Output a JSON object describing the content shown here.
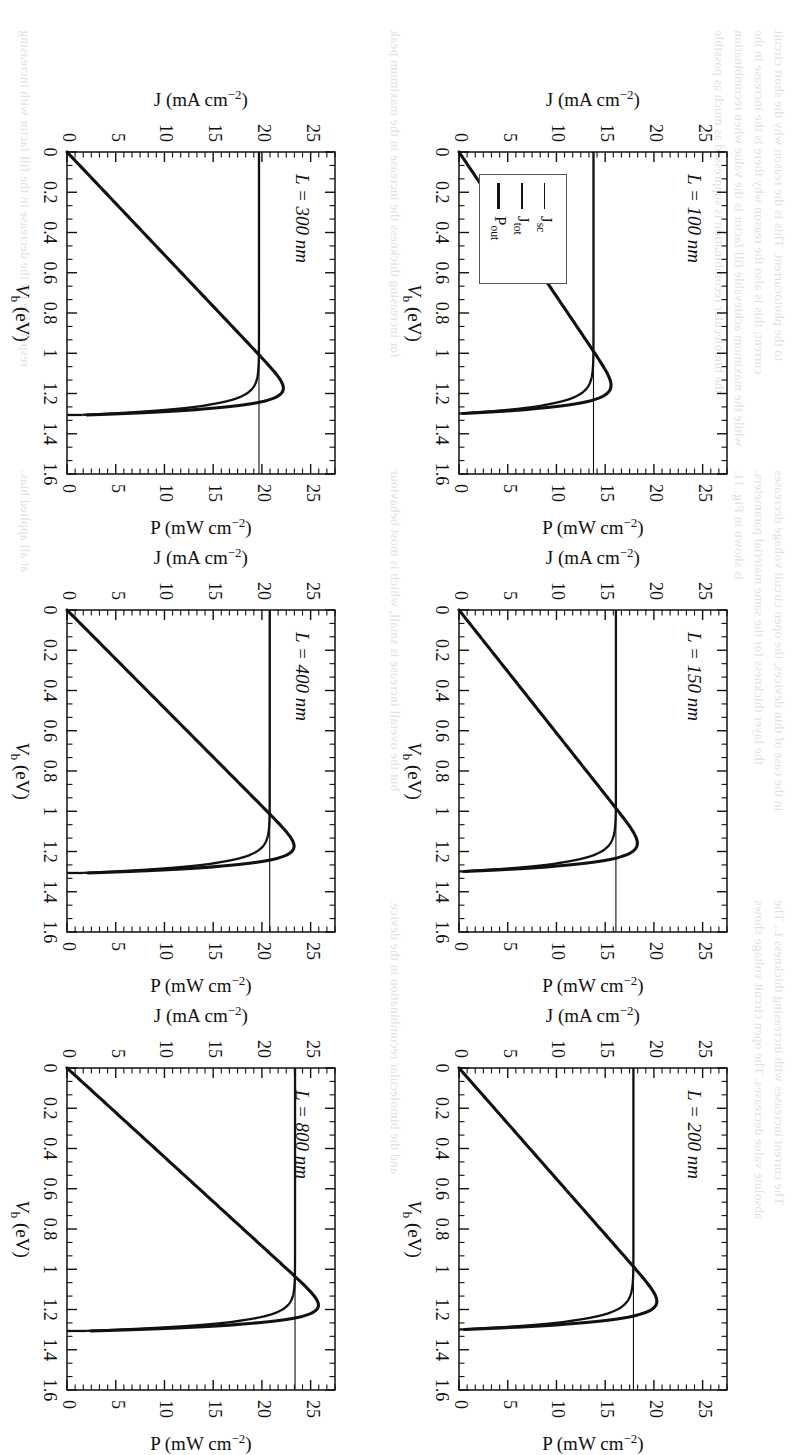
{
  "figure": {
    "orientation_deg": 90,
    "panel_count": 6,
    "xlabel": "V_b (eV)",
    "xlabel_main": "V",
    "xlabel_sub": "b",
    "xlabel_unit": "(eV)",
    "ylabel_left_main": "J",
    "ylabel_left_unit": "(mA cm",
    "ylabel_left_exp": "−2",
    "ylabel_left_close": ")",
    "ylabel_right_main": "P",
    "ylabel_right_unit": "(mW cm",
    "ylabel_right_exp": "−2",
    "ylabel_right_close": ")"
  },
  "legend": {
    "title": "",
    "items": [
      {
        "label_main": "J",
        "label_sub": "sc",
        "line_weight": 1.2
      },
      {
        "label_main": "J",
        "label_sub": "tot",
        "line_weight": 2.4
      },
      {
        "label_main": "P",
        "label_sub": "out",
        "line_weight": 3.4
      }
    ],
    "in_panel": "L = 100 nm"
  },
  "axes": {
    "x_ticks": [
      "0",
      "0.2",
      "0.4",
      "0.6",
      "0.8",
      "1",
      "1.2",
      "1.4",
      "1.6"
    ],
    "x_tick_values": [
      0,
      0.2,
      0.4,
      0.6,
      0.8,
      1.0,
      1.2,
      1.4,
      1.6
    ],
    "x_range": [
      0,
      1.6
    ],
    "x_minor_per_major": 2,
    "y_left_ticks": [
      "0",
      "5",
      "10",
      "15",
      "20",
      "25"
    ],
    "y_left_tick_values": [
      0,
      5,
      10,
      15,
      20,
      25
    ],
    "y_left_range": [
      0,
      27.5
    ],
    "y_right_ticks": [
      "0",
      "5",
      "10",
      "15",
      "20",
      "25"
    ],
    "y_right_tick_values": [
      0,
      5,
      10,
      15,
      20,
      25
    ],
    "y_right_range": [
      0,
      27.5
    ],
    "y_minor_per_major": 5
  },
  "chart_data": {
    "type": "line",
    "title": "",
    "xlabel": "V_b (eV)",
    "ylabel": "J (mA cm-2)",
    "y2label": "P (mW cm-2)",
    "xlim": [
      0,
      1.6
    ],
    "ylim": [
      0,
      27.5
    ],
    "y2lim": [
      0,
      27.5
    ],
    "grid": false,
    "legend_position": "lower-left of L = 100 nm panel",
    "legend_entries": [
      "J_sc",
      "J_tot",
      "P_out"
    ],
    "panels": [
      {
        "id": "L100",
        "annotation": "L = 100 nm",
        "annotation_L": "L",
        "annotation_rest": " = 100 nm",
        "thickness_nm": 100,
        "jsc": 13.8,
        "voc": 1.3,
        "jtot_knee_v": 1.17,
        "pmax": 15.6,
        "pmax_v": 1.22,
        "series": [
          {
            "name": "J_sc",
            "type": "horizontal-line",
            "value": 13.8
          },
          {
            "name": "J_tot",
            "type": "diode-jv",
            "jsc": 13.8,
            "voc": 1.3,
            "n": 0.042
          },
          {
            "name": "P_out",
            "type": "power",
            "pmax": 15.6,
            "vmax": 1.22
          }
        ]
      },
      {
        "id": "L150",
        "annotation": "L = 150 nm",
        "annotation_L": "L",
        "annotation_rest": " = 150 nm",
        "thickness_nm": 150,
        "jsc": 16.1,
        "voc": 1.3,
        "jtot_knee_v": 1.17,
        "pmax": 18.3,
        "pmax_v": 1.22,
        "series": [
          {
            "name": "J_sc",
            "type": "horizontal-line",
            "value": 16.1
          },
          {
            "name": "J_tot",
            "type": "diode-jv",
            "jsc": 16.1,
            "voc": 1.3,
            "n": 0.042
          },
          {
            "name": "P_out",
            "type": "power",
            "pmax": 18.3,
            "vmax": 1.22
          }
        ]
      },
      {
        "id": "L200",
        "annotation": "L = 200 nm",
        "annotation_L": "L",
        "annotation_rest": " = 200 nm",
        "thickness_nm": 200,
        "jsc": 17.9,
        "voc": 1.3,
        "jtot_knee_v": 1.17,
        "pmax": 20.3,
        "pmax_v": 1.22,
        "series": [
          {
            "name": "J_sc",
            "type": "horizontal-line",
            "value": 17.9
          },
          {
            "name": "J_tot",
            "type": "diode-jv",
            "jsc": 17.9,
            "voc": 1.3,
            "n": 0.042
          },
          {
            "name": "P_out",
            "type": "power",
            "pmax": 20.3,
            "vmax": 1.22
          }
        ]
      },
      {
        "id": "L300",
        "annotation": "L = 300 nm",
        "annotation_L": "L",
        "annotation_rest": " = 300 nm",
        "thickness_nm": 300,
        "jsc": 19.7,
        "voc": 1.31,
        "jtot_knee_v": 1.18,
        "pmax": 22.2,
        "pmax_v": 1.23,
        "series": [
          {
            "name": "J_sc",
            "type": "horizontal-line",
            "value": 19.7
          },
          {
            "name": "J_tot",
            "type": "diode-jv",
            "jsc": 19.7,
            "voc": 1.31,
            "n": 0.04
          },
          {
            "name": "P_out",
            "type": "power",
            "pmax": 22.2,
            "vmax": 1.23
          }
        ]
      },
      {
        "id": "L400",
        "annotation": "L = 400 nm",
        "annotation_L": "L",
        "annotation_rest": " = 400 nm",
        "thickness_nm": 400,
        "jsc": 20.8,
        "voc": 1.31,
        "jtot_knee_v": 1.18,
        "pmax": 23.3,
        "pmax_v": 1.23,
        "series": [
          {
            "name": "J_sc",
            "type": "horizontal-line",
            "value": 20.8
          },
          {
            "name": "J_tot",
            "type": "diode-jv",
            "jsc": 20.8,
            "voc": 1.31,
            "n": 0.04
          },
          {
            "name": "P_out",
            "type": "power",
            "pmax": 23.3,
            "vmax": 1.23
          }
        ]
      },
      {
        "id": "L800",
        "annotation": "L = 800 nm",
        "annotation_L": "L",
        "annotation_rest": " = 800 nm",
        "thickness_nm": 800,
        "jsc": 23.4,
        "voc": 1.31,
        "jtot_knee_v": 1.18,
        "pmax": 25.8,
        "pmax_v": 1.23,
        "series": [
          {
            "name": "J_sc",
            "type": "horizontal-line",
            "value": 23.4
          },
          {
            "name": "J_tot",
            "type": "diode-jv",
            "jsc": 23.4,
            "voc": 1.31,
            "n": 0.038
          },
          {
            "name": "P_out",
            "type": "power",
            "pmax": 25.8,
            "vmax": 1.23
          }
        ]
      }
    ]
  },
  "background_text": {
    "lines": [
      "to the photocurrent. This is the reason why the short circuit",
      "current; this is also the reason why there is the increase in the",
      "while the maximum achievable fill factor is the value when recombination",
      "the bimolecular recombination is suppressed as much as possible",
      "in the case of thin devices, the open circuit voltage decreases",
      "the layer thickness for the same material parameters.",
      "is shown in Fig. 11.",
      "The current increases with increasing thickness L. The",
      "absolute value decreases. The open circuit voltage shows",
      "for increasing thickness the increase in the maximum peak",
      "but the overall increase is small, which is most behaviour",
      "and the bimolecular recombination in the device.",
      "responsible for the decrease in the fill factor with increasing",
      "at all applied bias."
    ]
  }
}
